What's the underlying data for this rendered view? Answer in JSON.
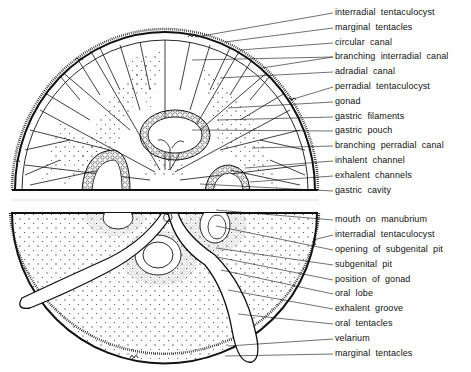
{
  "diagram": {
    "colors": {
      "ink": "#111111",
      "background": "#ffffff",
      "stipple": "#555555"
    },
    "upper_half_view": "aboral (exumbrellar) half showing canal system",
    "lower_half_view": "oral (subumbrellar) half showing manubrium and oral arms",
    "labels": [
      {
        "text": "interradial  tentaculocyst",
        "x": 335,
        "y": 13
      },
      {
        "text": "marginal  tentacles",
        "x": 335,
        "y": 28
      },
      {
        "text": "circular  canal",
        "x": 335,
        "y": 43
      },
      {
        "text": "branching  interradial  canal",
        "x": 335,
        "y": 57
      },
      {
        "text": "adradial  canal",
        "x": 335,
        "y": 72
      },
      {
        "text": "perradial  tentaculocyst",
        "x": 335,
        "y": 87
      },
      {
        "text": "gonad",
        "x": 335,
        "y": 102
      },
      {
        "text": "gastric  filaments",
        "x": 335,
        "y": 117
      },
      {
        "text": "gastric  pouch",
        "x": 335,
        "y": 131
      },
      {
        "text": "branching  perradial  canal",
        "x": 335,
        "y": 146
      },
      {
        "text": "inhalent  channel",
        "x": 335,
        "y": 161
      },
      {
        "text": "exhalent  channels",
        "x": 335,
        "y": 176
      },
      {
        "text": "gastric  cavity",
        "x": 335,
        "y": 191
      },
      {
        "text": "mouth  on  manubrium",
        "x": 335,
        "y": 220
      },
      {
        "text": "interradial  tentaculocyst",
        "x": 335,
        "y": 235
      },
      {
        "text": "opening  of  subgenital  pit",
        "x": 335,
        "y": 250
      },
      {
        "text": "subgenital  pit",
        "x": 335,
        "y": 265
      },
      {
        "text": "position  of  gonad",
        "x": 335,
        "y": 280
      },
      {
        "text": "oral  lobe",
        "x": 335,
        "y": 294
      },
      {
        "text": "exhalent  groove",
        "x": 335,
        "y": 309
      },
      {
        "text": "oral  tentacles",
        "x": 335,
        "y": 324
      },
      {
        "text": "velarium",
        "x": 335,
        "y": 339
      },
      {
        "text": "marginal  tentacles",
        "x": 335,
        "y": 354
      }
    ],
    "leaders": [
      [
        335,
        13,
        196,
        37
      ],
      [
        335,
        28,
        225,
        42
      ],
      [
        335,
        43,
        240,
        50
      ],
      [
        335,
        57,
        192,
        60
      ],
      [
        335,
        57,
        262,
        68
      ],
      [
        335,
        72,
        220,
        78
      ],
      [
        335,
        87,
        290,
        100
      ],
      [
        335,
        102,
        228,
        108
      ],
      [
        335,
        117,
        218,
        120
      ],
      [
        335,
        131,
        192,
        130
      ],
      [
        335,
        146,
        252,
        148
      ],
      [
        335,
        161,
        245,
        168
      ],
      [
        335,
        176,
        250,
        182
      ],
      [
        335,
        191,
        200,
        184
      ],
      [
        335,
        220,
        216,
        210
      ],
      [
        335,
        235,
        313,
        240
      ],
      [
        335,
        250,
        216,
        226
      ],
      [
        335,
        265,
        216,
        248
      ],
      [
        335,
        280,
        217,
        257
      ],
      [
        335,
        294,
        221,
        270
      ],
      [
        335,
        309,
        228,
        290
      ],
      [
        335,
        324,
        238,
        314
      ],
      [
        335,
        339,
        228,
        346
      ],
      [
        335,
        354,
        225,
        356
      ]
    ]
  }
}
